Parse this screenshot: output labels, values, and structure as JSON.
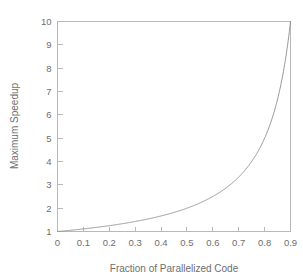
{
  "chart_data": {
    "type": "line",
    "title": "",
    "xlabel": "Fraction of Parallelized Code",
    "ylabel": "Maximum Speedup",
    "xlim": [
      0,
      0.9
    ],
    "ylim": [
      1,
      10
    ],
    "grid": false,
    "legend": null,
    "formula": "speedup = 1 / (1 - p)",
    "x_ticks": [
      "0",
      "0.1",
      "0.2",
      "0.3",
      "0.4",
      "0.5",
      "0.6",
      "0.7",
      "0.8",
      "0.9"
    ],
    "x_tick_values": [
      0,
      0.1,
      0.2,
      0.3,
      0.4,
      0.5,
      0.6,
      0.7,
      0.8,
      0.9
    ],
    "y_ticks": [
      "1",
      "2",
      "3",
      "4",
      "5",
      "6",
      "7",
      "8",
      "9",
      "10"
    ],
    "y_tick_values": [
      1,
      2,
      3,
      4,
      5,
      6,
      7,
      8,
      9,
      10
    ],
    "series": [
      {
        "name": "Maximum Speedup",
        "color": "#8d8d8d",
        "x": [
          0,
          0.05,
          0.1,
          0.15,
          0.2,
          0.25,
          0.3,
          0.35,
          0.4,
          0.45,
          0.5,
          0.55,
          0.6,
          0.65,
          0.7,
          0.75,
          0.8,
          0.82,
          0.84,
          0.86,
          0.88,
          0.89,
          0.895,
          0.9
        ],
        "values": [
          1,
          1.05,
          1.11,
          1.18,
          1.25,
          1.33,
          1.43,
          1.54,
          1.67,
          1.82,
          2,
          2.22,
          2.5,
          2.86,
          3.33,
          4,
          5,
          5.56,
          6.25,
          7.14,
          8.33,
          9.09,
          9.52,
          10
        ]
      }
    ]
  },
  "axes": {
    "y_axis_title": "Maximum Speedup",
    "x_axis_title": "Fraction of Parallelized Code"
  },
  "colors": {
    "background": "#ffffff",
    "frame": "#b9b9b9",
    "curve": "#8d8d8d",
    "text": "#6e6e6e"
  }
}
